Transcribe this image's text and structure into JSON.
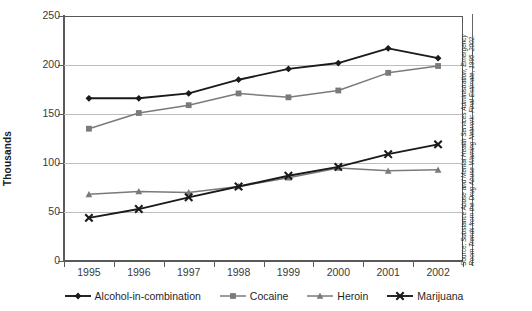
{
  "chart_data": {
    "type": "line",
    "title": "",
    "xlabel": "",
    "ylabel": "Thousands",
    "categories": [
      "1995",
      "1996",
      "1997",
      "1998",
      "1999",
      "2000",
      "2001",
      "2002"
    ],
    "ylim": [
      0,
      250
    ],
    "yticks": [
      0,
      50,
      100,
      150,
      200,
      250
    ],
    "grid": "horizontal",
    "legend_position": "bottom",
    "series": [
      {
        "name": "Alcohol-in-combination",
        "color": "#1a1a1a",
        "marker": "diamond",
        "values": [
          166,
          166,
          171,
          185,
          196,
          202,
          217,
          207
        ]
      },
      {
        "name": "Cocaine",
        "color": "#7a7a7a",
        "marker": "square",
        "values": [
          135,
          151,
          159,
          171,
          167,
          174,
          192,
          199
        ]
      },
      {
        "name": "Heroin",
        "color": "#7a7a7a",
        "marker": "triangle",
        "values": [
          68,
          71,
          70,
          76,
          85,
          95,
          92,
          93
        ]
      },
      {
        "name": "Marijuana",
        "color": "#1a1a1a",
        "marker": "cross",
        "values": [
          44,
          53,
          65,
          76,
          87,
          96,
          109,
          119
        ]
      }
    ],
    "source_prefix": "Source: ",
    "source_emphasis": "Substance Abuse and Mental Health Services Administration, Emergency Room Trends from the Drug Abuse Warning Network: Final Estimate, 1995–2002."
  }
}
